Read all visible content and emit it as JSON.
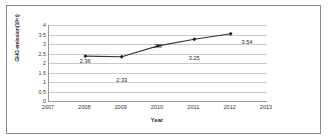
{
  "chart_data": {
    "type": "line",
    "title": "",
    "xlabel": "Year",
    "ylabel": "GHG emission(10⁹t)",
    "categories": [
      "2007",
      "2008",
      "2009",
      "2010",
      "2011",
      "2012",
      "2013"
    ],
    "x": [
      2007,
      2008,
      2009,
      2010,
      2011,
      2012,
      2013
    ],
    "series": [
      {
        "name": "GHG emission",
        "values": [
          null,
          2.36,
          2.33,
          2.9,
          3.25,
          3.54,
          null
        ],
        "color": "#333333",
        "marker": "diamond"
      }
    ],
    "point_labels": [
      {
        "year": "2008",
        "value": 2.36,
        "text": "2.36",
        "position": "above"
      },
      {
        "year": "2009",
        "value": 2.33,
        "text": "2.33",
        "position": "below"
      },
      {
        "year": "2010",
        "value": 2.9,
        "text": "2.9",
        "position": "above"
      },
      {
        "year": "2011",
        "value": 3.25,
        "text": "3.25",
        "position": "below"
      },
      {
        "year": "2012",
        "value": 3.54,
        "text": "3.54",
        "position": "right"
      }
    ],
    "ylim": [
      0,
      4
    ],
    "xlim": [
      2007,
      2013
    ],
    "yticks": [
      "0",
      "0.5",
      "1",
      "1.5",
      "2",
      "2.5",
      "3",
      "3.5",
      "4"
    ],
    "ytick_values": [
      0,
      0.5,
      1,
      1.5,
      2,
      2.5,
      3,
      3.5,
      4
    ],
    "grid": true,
    "grid_axis": "y",
    "legend": false,
    "legend_position": "none",
    "border": true,
    "colors": {
      "line": "#333333",
      "marker": "#1a1a1a",
      "grid": "#c9c9c9",
      "axis": "#9a9a9a",
      "text": "#2b2b2b",
      "frame": "#8a8a8a",
      "background": "#ffffff"
    }
  }
}
